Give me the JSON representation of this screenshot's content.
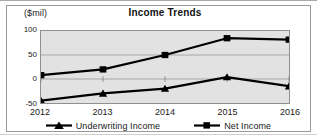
{
  "chart_data": {
    "type": "line",
    "title": "Income Trends",
    "xlabel": "",
    "ylabel": "($mil)",
    "categories": [
      "2012",
      "2013",
      "2014",
      "2015",
      "2016"
    ],
    "ylim": [
      -50,
      100
    ],
    "yticks": [
      "100",
      "50",
      "0",
      "-50"
    ],
    "ytick_values": [
      100,
      50,
      0,
      -50
    ],
    "grid": "horizontal",
    "legend_position": "bottom",
    "plot_background": "#e2e2e2",
    "series": [
      {
        "name": "Underwriting Income",
        "marker": "triangle",
        "color": "#000000",
        "values": [
          -45,
          -30,
          -20,
          4,
          -15
        ]
      },
      {
        "name": "Net Income",
        "marker": "square",
        "color": "#000000",
        "values": [
          8,
          20,
          50,
          85,
          82
        ]
      }
    ]
  },
  "legend": {
    "entries": [
      {
        "label": "Underwriting Income",
        "marker": "triangle"
      },
      {
        "label": "Net Income",
        "marker": "square"
      }
    ]
  }
}
